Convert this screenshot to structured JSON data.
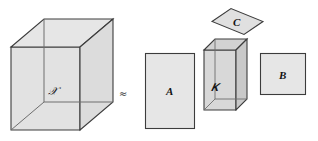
{
  "figure": {
    "relation_symbol": "≈",
    "colors": {
      "face_light": "#e3e3e3",
      "face_mid": "#d9d9d9",
      "face_dark": "#cfcfcf",
      "stroke": "#3c3c3c",
      "stroke_light": "#6e6e6e",
      "text": "#141414",
      "background": "#ffffff"
    },
    "shapes": [
      {
        "id": "cube-x",
        "kind": "cube",
        "label": "𝒳",
        "label_plain": "X",
        "role": "left-hand-side tensor"
      },
      {
        "id": "rect-a",
        "kind": "rectangle",
        "label": "A",
        "role": "factor matrix"
      },
      {
        "id": "box-g",
        "kind": "box",
        "label": "𝒢",
        "label_plain": "G",
        "role": "core tensor"
      },
      {
        "id": "rect-b",
        "kind": "rectangle",
        "label": "B",
        "role": "factor matrix"
      },
      {
        "id": "diamond-c",
        "kind": "parallelogram",
        "label": "C",
        "role": "factor matrix"
      }
    ]
  }
}
